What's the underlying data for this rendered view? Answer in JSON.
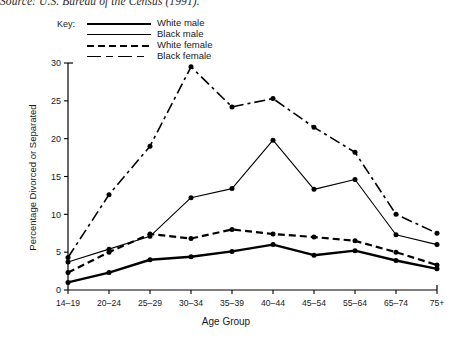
{
  "source_note": "Source: U.S. Bureau of the Census (1991).",
  "legend": {
    "title": "Key:",
    "entries": [
      {
        "label": "White male",
        "style": "solid-thick",
        "swatch": "sw-wm"
      },
      {
        "label": "Black male",
        "style": "solid-thin",
        "swatch": "sw-bm"
      },
      {
        "label": "White female",
        "style": "dashed",
        "swatch": "sw-wf"
      },
      {
        "label": "Black female",
        "style": "dash-dot",
        "swatch": "sw-bf"
      }
    ]
  },
  "chart_data": {
    "type": "line",
    "title": "",
    "xlabel": "Age Group",
    "ylabel": "Percentage Divorced or Separated",
    "categories": [
      "14–19",
      "20–24",
      "25–29",
      "30–34",
      "35–39",
      "40–44",
      "45–54",
      "55–64",
      "65–74",
      "75+"
    ],
    "ylim": [
      0,
      30
    ],
    "yticks": [
      0,
      5,
      10,
      15,
      20,
      25,
      30
    ],
    "grid": false,
    "legend_position": "top-left-outside",
    "markers": "filled-circle",
    "series": [
      {
        "name": "White male",
        "style": "solid-thick",
        "color": "#000000",
        "values": [
          1.0,
          2.3,
          4.0,
          4.4,
          5.1,
          6.0,
          4.6,
          5.2,
          3.9,
          2.8
        ]
      },
      {
        "name": "Black male",
        "style": "solid-thin",
        "color": "#000000",
        "values": [
          3.7,
          5.4,
          7.1,
          12.2,
          13.4,
          19.8,
          13.3,
          14.6,
          7.3,
          6.0
        ]
      },
      {
        "name": "White female",
        "style": "dashed",
        "color": "#000000",
        "values": [
          2.3,
          5.0,
          7.4,
          6.8,
          8.0,
          7.4,
          7.0,
          6.5,
          5.0,
          3.3
        ]
      },
      {
        "name": "Black female",
        "style": "dash-dot",
        "color": "#000000",
        "values": [
          4.3,
          12.6,
          19.0,
          29.5,
          24.2,
          25.3,
          21.5,
          18.2,
          10.0,
          7.5
        ]
      }
    ]
  }
}
